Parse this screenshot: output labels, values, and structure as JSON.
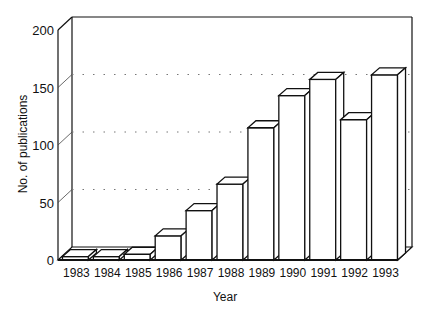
{
  "chart_data": {
    "type": "bar",
    "style": "3d",
    "title": "",
    "xlabel": "Year",
    "ylabel": "No. of publications",
    "categories": [
      "1983",
      "1984",
      "1985",
      "1986",
      "1987",
      "1988",
      "1989",
      "1990",
      "1991",
      "1992",
      "1993"
    ],
    "values": [
      3,
      3,
      5,
      21,
      43,
      66,
      115,
      143,
      157,
      122,
      161
    ],
    "ylim": [
      0,
      200
    ],
    "yticks": [
      0,
      50,
      100,
      150,
      200
    ],
    "grid": "dotted horizontal on back wall",
    "legend": null
  },
  "axes": {
    "xlabel": "Year",
    "ylabel": "No. of publications",
    "ytick_labels": [
      "0",
      "50",
      "100",
      "150",
      "200"
    ]
  },
  "colors": {
    "bar_fill": "#ffffff",
    "bar_stroke": "#111111",
    "grid": "#777777",
    "background": "#ffffff"
  }
}
